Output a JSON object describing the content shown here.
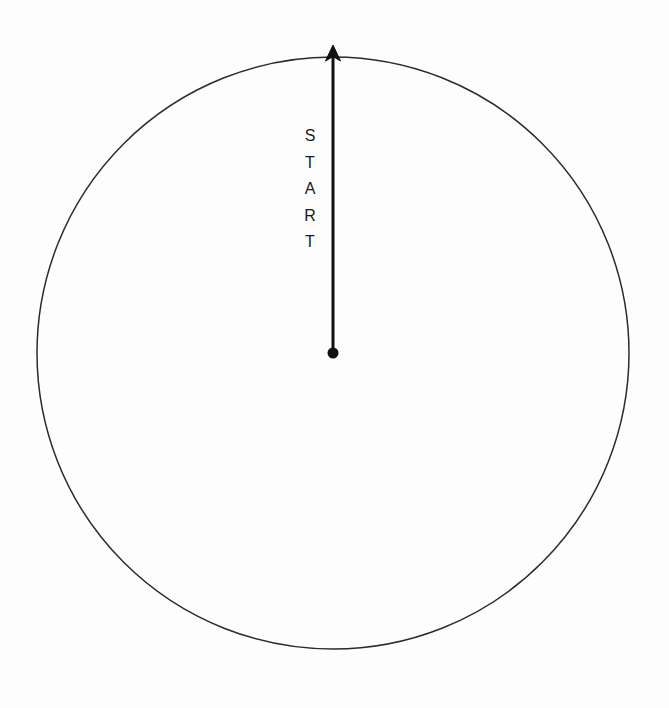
{
  "figure": {
    "background_color": "#fdfdfe",
    "width": 669,
    "height": 708
  },
  "circle": {
    "name": "boundary-circle",
    "center_x": 333,
    "center_y": 353,
    "radius": 296,
    "stroke_color": "#2b2b2b",
    "stroke_width": 1.5,
    "fill": "none"
  },
  "arrow": {
    "name": "start-direction-arrow",
    "color": "#111111",
    "line_width": 3,
    "from_x": 333,
    "from_y": 353,
    "to_x": 333,
    "to_y": 45,
    "head_width": 15,
    "head_height": 16,
    "origin_dot_radius": 5.5
  },
  "label": {
    "text": "START",
    "orientation": "vertical-stacked",
    "letters": [
      "S",
      "T",
      "A",
      "R",
      "T"
    ],
    "color": "#1a1a1a",
    "font_size_px": 16,
    "top_y": 135,
    "bottom_y": 268,
    "x": 310
  }
}
